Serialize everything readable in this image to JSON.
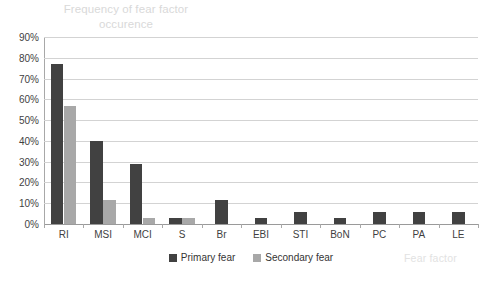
{
  "chart_data": {
    "type": "bar",
    "title": "Frequency of fear factor occurence",
    "title_line1": "Frequency of fear factor",
    "title_line2": "occurence",
    "xlabel": "Fear factor",
    "ylabel": "",
    "ylim": [
      0,
      90
    ],
    "ytick_step": 10,
    "ytick_labels": [
      "90%",
      "80%",
      "70%",
      "60%",
      "50%",
      "40%",
      "30%",
      "20%",
      "10%",
      "0%"
    ],
    "ytick_values": [
      90,
      80,
      70,
      60,
      50,
      40,
      30,
      20,
      10,
      0
    ],
    "grid": true,
    "grid_axis": "y",
    "legend_position": "bottom",
    "categories": [
      "RI",
      "MSI",
      "MCI",
      "S",
      "Br",
      "EBI",
      "STI",
      "BoN",
      "PC",
      "PA",
      "LE"
    ],
    "series": [
      {
        "name": "Primary fear",
        "color": "#414141",
        "values": [
          77,
          40,
          29,
          3,
          11.5,
          3,
          6,
          3,
          6,
          6,
          6
        ]
      },
      {
        "name": "Secondary fear",
        "color": "#a8a8a8",
        "values": [
          57,
          11.5,
          3,
          3,
          0,
          0,
          0,
          0,
          0,
          0,
          0
        ]
      }
    ]
  },
  "colors": {
    "primary_series": "#414141",
    "secondary_series": "#a8a8a8",
    "gridline": "#d3d3d3",
    "axis": "#a8a8a8",
    "title_text": "#d9d9d9",
    "tick_text": "#3f3f3f",
    "background": "#ffffff"
  }
}
